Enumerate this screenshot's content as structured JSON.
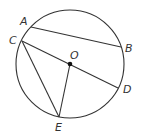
{
  "diagram": {
    "type": "circle-geometry",
    "colors": {
      "ink": "#333333",
      "background": "#ffffff"
    },
    "circle": {
      "center_label": "O"
    },
    "points": [
      {
        "id": "A",
        "label": "A"
      },
      {
        "id": "B",
        "label": "B"
      },
      {
        "id": "C",
        "label": "C"
      },
      {
        "id": "D",
        "label": "D"
      },
      {
        "id": "E",
        "label": "E"
      },
      {
        "id": "O",
        "label": "O"
      }
    ],
    "segments": [
      {
        "from": "A",
        "to": "B",
        "kind": "chord"
      },
      {
        "from": "C",
        "to": "D",
        "kind": "diameter"
      },
      {
        "from": "C",
        "to": "E",
        "kind": "chord"
      },
      {
        "from": "O",
        "to": "E",
        "kind": "radius"
      }
    ]
  }
}
